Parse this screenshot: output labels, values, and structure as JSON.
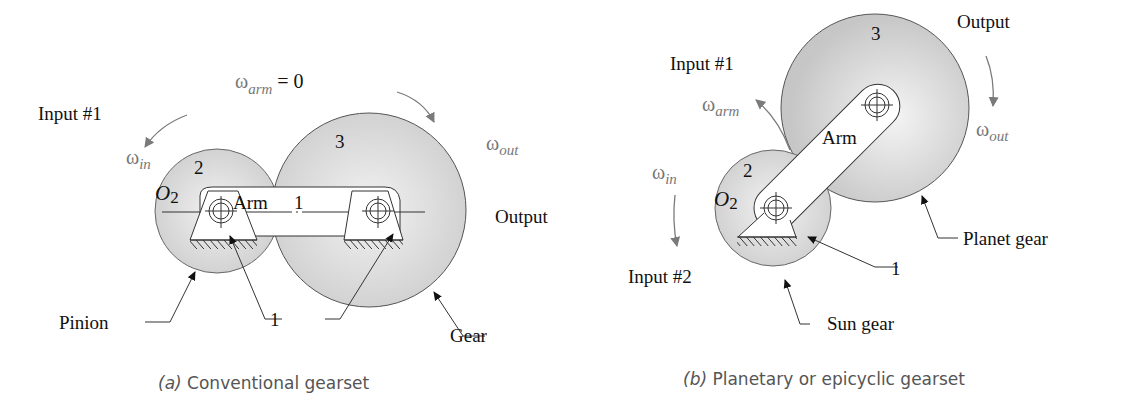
{
  "panel_a": {
    "caption_letter": "(a)",
    "caption_text": "Conventional gearset",
    "omega_arm": "ω",
    "omega_arm_sub": "arm",
    "omega_arm_eq": " = 0",
    "input_label": "Input #1",
    "omega_in": "ω",
    "omega_in_sub": "in",
    "omega_out": "ω",
    "omega_out_sub": "out",
    "output_label": "Output",
    "pinion_number": "2",
    "gear_number": "3",
    "pivot_label": "O",
    "pivot_sub": "2",
    "arm_label": "Arm",
    "arm_number": "1",
    "ground_number": "1",
    "pinion_label": "Pinion",
    "gear_label": "Gear"
  },
  "panel_b": {
    "caption_letter": "(b)",
    "caption_text": "Planetary or epicyclic gearset",
    "input1_label": "Input #1",
    "input2_label": "Input #2",
    "omega_arm": "ω",
    "omega_arm_sub": "arm",
    "omega_in": "ω",
    "omega_in_sub": "in",
    "omega_out": "ω",
    "omega_out_sub": "out",
    "output_label": "Output",
    "sun_number": "2",
    "planet_number": "3",
    "pivot_label": "O",
    "pivot_sub": "2",
    "arm_label": "Arm",
    "ground_number": "1",
    "planet_label": "Planet gear",
    "sun_label": "Sun gear"
  },
  "colors": {
    "gear_fill": "#d4d4d4",
    "gear_light": "#ececec",
    "line": "#333333",
    "arrow_grey": "#7a7a7a"
  }
}
